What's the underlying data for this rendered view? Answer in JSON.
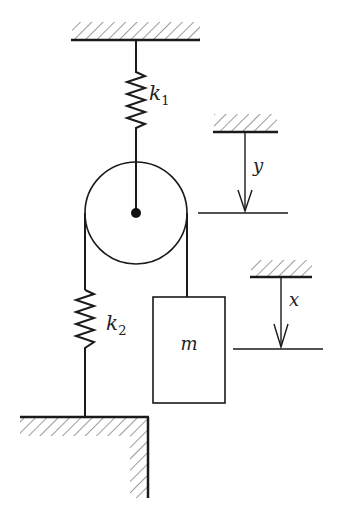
{
  "diagram": {
    "type": "mechanical-system",
    "labels": {
      "spring_top": "k",
      "spring_top_sub": "1",
      "spring_bottom": "k",
      "spring_bottom_sub": "2",
      "mass": "m",
      "pulley_displacement": "y",
      "mass_displacement": "x"
    },
    "colors": {
      "stroke": "#1a1a1a",
      "hatch": "#555555",
      "background": "#ffffff"
    }
  }
}
